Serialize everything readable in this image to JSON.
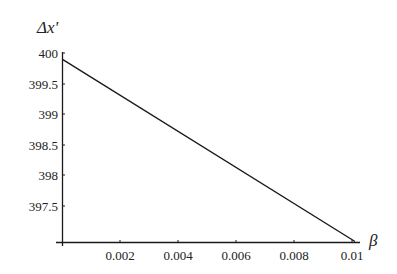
{
  "chart_data": {
    "type": "line",
    "title": "",
    "xlabel": "β",
    "ylabel": "Δx'",
    "xlim": [
      0,
      0.01
    ],
    "ylim": [
      397.0,
      400.0
    ],
    "x_ticks": [
      "0.002",
      "0.004",
      "0.006",
      "0.008",
      "0.01"
    ],
    "y_ticks": [
      "400",
      "399.5",
      "399",
      "398.5",
      "398",
      "397.5"
    ],
    "grid": false,
    "legend": null,
    "series": [
      {
        "name": "Δx'",
        "x": [
          0,
          0.01
        ],
        "y": [
          399.9,
          397.0
        ]
      }
    ]
  },
  "colors": {
    "line": "#1a1a1a",
    "axis": "#1a1a1a",
    "text": "#222222",
    "background": "#ffffff"
  }
}
